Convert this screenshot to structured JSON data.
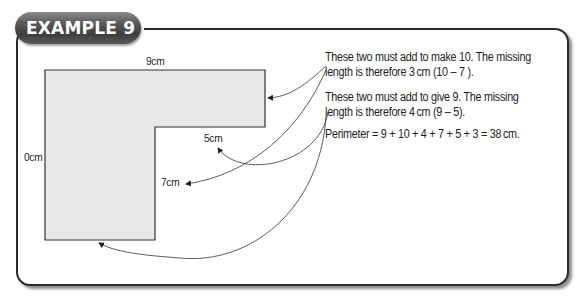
{
  "badge": {
    "title": "EXAMPLE 9"
  },
  "diagram": {
    "shape": "L-shape",
    "fill_color": "#e8e8e8",
    "stroke_color": "#333333",
    "labels": {
      "top": "9cm",
      "left": "0cm",
      "inner_horizontal": "5cm",
      "inner_vertical": "7cm"
    }
  },
  "notes": [
    {
      "line1": "These two must add to make 10. The missing",
      "line2": "length is therefore 3 cm (10 – 7 )."
    },
    {
      "line1": "These two must add to give 9. The missing",
      "line2": "length is therefore 4 cm (9 – 5)."
    }
  ],
  "perimeter": "Perimeter = 9 + 10 + 4 + 7 + 5 + 3 = 38 cm.",
  "colors": {
    "badge": "#4a4a4a",
    "frame": "#2a2a2a",
    "shape_fill": "#e8e8e8"
  }
}
